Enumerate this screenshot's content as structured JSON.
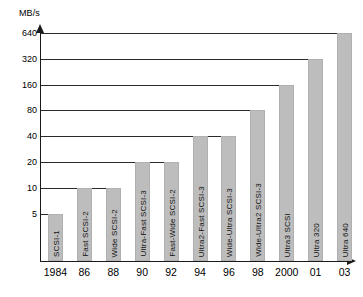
{
  "chart_data": {
    "type": "bar",
    "title": "",
    "xlabel": "",
    "ylabel": "MB/s",
    "yscale": "log2",
    "ylim": [
      0,
      640
    ],
    "grid": true,
    "legend": false,
    "y_ticks": [
      {
        "label": "640",
        "value": 640
      },
      {
        "label": "320",
        "value": 320
      },
      {
        "label": "160",
        "value": 160
      },
      {
        "label": "80",
        "value": 80
      },
      {
        "label": "40",
        "value": 40
      },
      {
        "label": "20",
        "value": 20
      },
      {
        "label": "10",
        "value": 10
      },
      {
        "label": "5",
        "value": 5
      }
    ],
    "categories": [
      "1984",
      "86",
      "88",
      "90",
      "92",
      "94",
      "96",
      "98",
      "2000",
      "01",
      "03"
    ],
    "values": [
      5,
      10,
      10,
      20,
      20,
      40,
      40,
      80,
      160,
      320,
      640
    ],
    "bar_labels": [
      "SCSI-1",
      "Fast SCSI-2",
      "Wide SCSI-2",
      "Ultra-Fast SCSI-3",
      "Fast-Wide SCSI-2",
      "Ultra2-Fast SCSI-3",
      "Wide-Ultra SCSI-3",
      "Wide-Ultra2 SCSI-3",
      "Ultra3 SCSI",
      "Ultra 320",
      "Ultra 640"
    ],
    "bar_color": "#bdbdbd",
    "axis_color": "#1a1a1a"
  }
}
